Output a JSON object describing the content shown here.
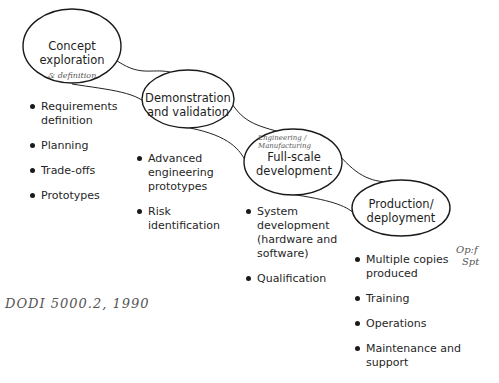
{
  "phases": [
    {
      "id": "concept",
      "label_line1": "Concept",
      "label_line2": "exploration",
      "annotation": "& definition",
      "bullets": [
        "Requirements definition",
        "Planning",
        "Trade-offs",
        "Prototypes"
      ]
    },
    {
      "id": "demonstration",
      "label_line1": "Demonstration",
      "label_line2": "and validation",
      "bullets": [
        "Advanced engineering prototypes",
        "Risk identification"
      ]
    },
    {
      "id": "fullscale",
      "label_line1": "Full-scale",
      "label_line2": "development",
      "annotation": "Engineering / Manufacturing",
      "bullets": [
        "System development (hardware and software)",
        "Qualification"
      ]
    },
    {
      "id": "production",
      "label_line1": "Production/",
      "label_line2": "deployment",
      "bullets": [
        "Multiple copies produced",
        "Training",
        "Operations",
        "Maintenance and support"
      ]
    }
  ],
  "handwritten": {
    "reference": "DODI 5000.2, 1990",
    "side_note_line1": "Op:f",
    "side_note_line2": "Spt"
  },
  "colors": {
    "ink": "#1a1a1a",
    "pencil": "#555555"
  }
}
